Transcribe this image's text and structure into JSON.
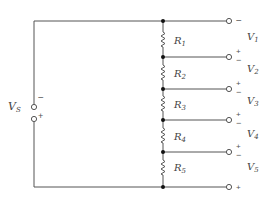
{
  "diagram": {
    "type": "voltage-divider-circuit",
    "source": {
      "label": "V",
      "subscript": "S",
      "top_polarity": "−",
      "bottom_polarity": "+"
    },
    "resistors": [
      {
        "label": "R",
        "subscript": "1"
      },
      {
        "label": "R",
        "subscript": "2"
      },
      {
        "label": "R",
        "subscript": "3"
      },
      {
        "label": "R",
        "subscript": "4"
      },
      {
        "label": "R",
        "subscript": "5"
      }
    ],
    "outputs": [
      {
        "label": "V",
        "subscript": "1"
      },
      {
        "label": "V",
        "subscript": "2"
      },
      {
        "label": "V",
        "subscript": "3"
      },
      {
        "label": "V",
        "subscript": "4"
      },
      {
        "label": "V",
        "subscript": "5"
      }
    ],
    "terminal_signs": [
      {
        "plus": "",
        "minus": "−"
      },
      {
        "plus": "+",
        "minus": "−"
      },
      {
        "plus": "+",
        "minus": "−"
      },
      {
        "plus": "+",
        "minus": "−"
      },
      {
        "plus": "+",
        "minus": "−"
      },
      {
        "plus": "+",
        "minus": ""
      }
    ],
    "colors": {
      "wire": "#555555",
      "node": "#111111",
      "text": "#444444"
    }
  }
}
